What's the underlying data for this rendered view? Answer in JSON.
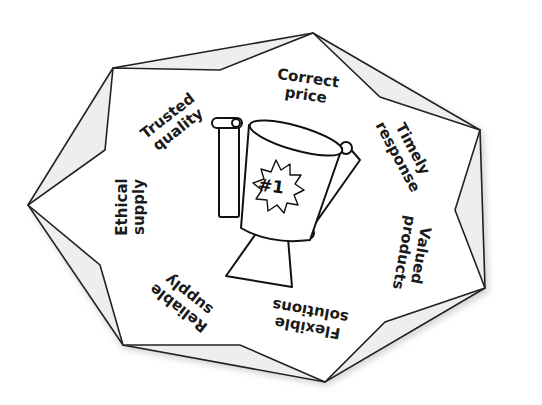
{
  "diagram": {
    "title": "",
    "center": {
      "icon": "trophy-icon",
      "badge": "#1"
    },
    "labels": [
      {
        "id": "correct-price",
        "line1": "Correct",
        "line2": "price"
      },
      {
        "id": "timely-response",
        "line1": "Timely",
        "line2": "response"
      },
      {
        "id": "valued-products",
        "line1": "Valued",
        "line2": "products"
      },
      {
        "id": "flexible-solutions",
        "line1": "Flexible",
        "line2": "solutions"
      },
      {
        "id": "reliable-supply",
        "line1": "Reliable",
        "line2": "supply"
      },
      {
        "id": "ethical-supply",
        "line1": "Ethical",
        "line2": "supply"
      },
      {
        "id": "trusted-quality",
        "line1": "Trusted",
        "line2": "quality"
      }
    ],
    "colors": {
      "stroke": "#222222",
      "shadow": "#c8c8c8",
      "background": "#ffffff"
    }
  }
}
